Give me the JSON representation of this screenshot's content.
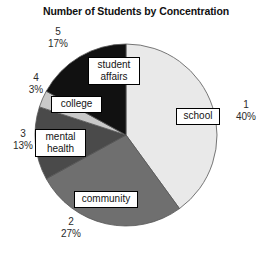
{
  "chart_data": {
    "type": "pie",
    "title": "Number of Students by Concentration",
    "xlabel": "",
    "ylabel": "",
    "legend": "none",
    "grid": false,
    "start_angle_deg": 0,
    "direction": "clockwise",
    "categories": [
      "school",
      "community",
      "mental health",
      "college",
      "student affairs"
    ],
    "values": [
      40,
      27,
      13,
      3,
      17
    ],
    "slices": [
      {
        "index": "1",
        "label": "school",
        "percent": 40,
        "percent_text": "40%",
        "color": "#e9e9e9"
      },
      {
        "index": "2",
        "label": "community",
        "percent": 27,
        "percent_text": "27%",
        "color": "#6f6f6f"
      },
      {
        "index": "3",
        "label": "mental\nhealth",
        "percent": 13,
        "percent_text": "13%",
        "color": "#4a4a4a"
      },
      {
        "index": "4",
        "label": "college",
        "percent": 3,
        "percent_text": "3%",
        "color": "#c9c9c9"
      },
      {
        "index": "5",
        "label": "student\naffairs",
        "percent": 17,
        "percent_text": "17%",
        "color": "#111111"
      }
    ],
    "colors": {
      "school": "#e9e9e9",
      "community": "#6f6f6f",
      "mental_health": "#4a4a4a",
      "college": "#c9c9c9",
      "student_affairs": "#111111",
      "outline": "#555555",
      "label_box_border": "#000000",
      "label_box_fill": "#ffffff",
      "text": "#141414",
      "background": "#ffffff"
    }
  }
}
